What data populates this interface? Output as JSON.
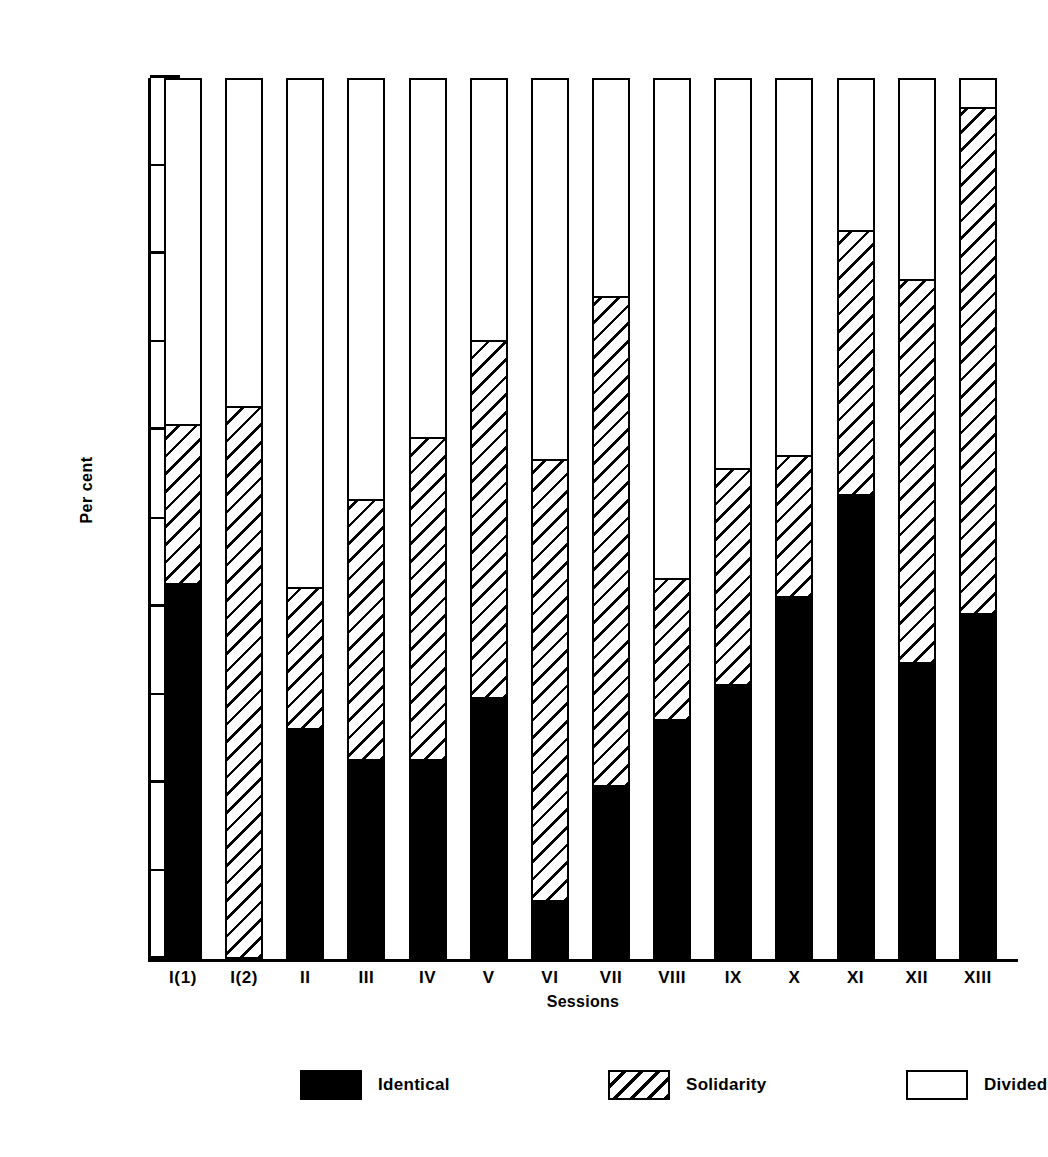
{
  "chart_data": {
    "type": "bar",
    "subtype": "stacked-bar-100-percent",
    "title": "",
    "xlabel": "Sessions",
    "ylabel": "Per cent",
    "ylim": [
      0,
      100
    ],
    "yticks": [
      0,
      20,
      40,
      60,
      80,
      100
    ],
    "ytick_labels": [
      "0",
      "20",
      "40",
      "60",
      "80",
      "100"
    ],
    "minor_yticks": [
      10,
      30,
      50,
      70,
      90
    ],
    "grid": false,
    "legend_position": "bottom",
    "categories": [
      "I(1)",
      "I(2)",
      "II",
      "III",
      "IV",
      "V",
      "VI",
      "VII",
      "VIII",
      "IX",
      "X",
      "XI",
      "XII",
      "XIII"
    ],
    "series": [
      {
        "name": "Identical",
        "pattern": "solid-black",
        "color": "#000000",
        "values": [
          42.5,
          0.0,
          26.0,
          22.5,
          22.5,
          29.5,
          6.5,
          19.5,
          27.0,
          31.0,
          41.0,
          52.5,
          33.5,
          39.0
        ]
      },
      {
        "name": "Solidarity",
        "pattern": "diagonal-hatch",
        "color": "#ffffff",
        "values": [
          18.0,
          62.5,
          16.0,
          29.5,
          36.5,
          40.5,
          50.0,
          55.5,
          16.0,
          24.5,
          16.0,
          30.0,
          43.5,
          57.5
        ]
      },
      {
        "name": "Divided",
        "pattern": "empty-white",
        "color": "#ffffff",
        "values": [
          39.5,
          37.5,
          58.0,
          48.0,
          41.0,
          30.0,
          43.5,
          25.0,
          57.0,
          44.5,
          43.0,
          17.5,
          23.0,
          3.5
        ]
      }
    ],
    "cumulative_tops": {
      "identical": [
        42.5,
        0.0,
        26.0,
        22.5,
        22.5,
        29.5,
        6.5,
        19.5,
        27.0,
        31.0,
        41.0,
        52.5,
        33.5,
        39.0
      ],
      "solidarity": [
        60.5,
        62.5,
        42.0,
        52.0,
        59.0,
        70.0,
        56.5,
        75.0,
        43.0,
        55.5,
        57.0,
        82.5,
        77.0,
        96.5
      ]
    }
  },
  "axes": {
    "ylabel": "Per cent",
    "xlabel": "Sessions"
  },
  "legend": {
    "items": [
      {
        "label": "Identical",
        "pattern": "solid-black"
      },
      {
        "label": "Solidarity",
        "pattern": "diagonal-hatch"
      },
      {
        "label": "Divided",
        "pattern": "empty-white"
      }
    ]
  },
  "colors": {
    "ink": "#000000",
    "paper": "#ffffff"
  }
}
